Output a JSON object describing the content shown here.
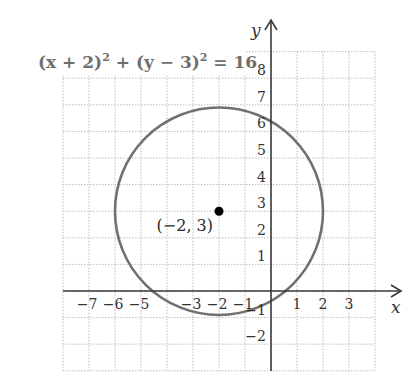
{
  "chart_data": {
    "type": "line",
    "title": "",
    "equation": "(x + 2)² + (y − 3)² = 16",
    "equation_parts": {
      "part1": "(x + 2)",
      "exp1": "2",
      "part2": " + (y − 3)",
      "exp2": "2",
      "part3": " = 16"
    },
    "xlabel": "x",
    "ylabel": "y",
    "xlim": [
      -8,
      4
    ],
    "ylim": [
      -3,
      9
    ],
    "grid": true,
    "grid_style": "dotted",
    "x_ticks": [
      {
        "value": -7,
        "label": "−7"
      },
      {
        "value": -6,
        "label": "−6"
      },
      {
        "value": -5,
        "label": "−5"
      },
      {
        "value": -3,
        "label": "−3"
      },
      {
        "value": -2,
        "label": "−2"
      },
      {
        "value": -1,
        "label": "−1"
      },
      {
        "value": 1,
        "label": "1"
      },
      {
        "value": 2,
        "label": "2"
      },
      {
        "value": 3,
        "label": "3"
      }
    ],
    "y_ticks": [
      {
        "value": 8,
        "label": "8"
      },
      {
        "value": 7,
        "label": "7"
      },
      {
        "value": 6,
        "label": "6"
      },
      {
        "value": 5,
        "label": "5"
      },
      {
        "value": 4,
        "label": "4"
      },
      {
        "value": 3,
        "label": "3"
      },
      {
        "value": 2,
        "label": "2"
      },
      {
        "value": 1,
        "label": "1"
      },
      {
        "value": -1,
        "label": "−1"
      },
      {
        "value": -2,
        "label": "−2"
      }
    ],
    "circle": {
      "center_x": -2,
      "center_y": 3,
      "radius": 4
    },
    "points": [
      {
        "x": -2,
        "y": 3,
        "label": "(−2, 3)"
      }
    ],
    "colors": {
      "circle": "#707070",
      "axes": "#3a3a3a",
      "grid": "#bdbdbd",
      "point": "#000000",
      "equation": "#6e6e6e"
    }
  }
}
